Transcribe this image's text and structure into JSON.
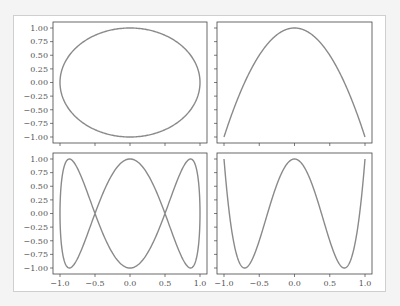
{
  "figure": {
    "frame_color": "#cfcfcf",
    "line_color": "#8a8a8a",
    "axis_color": "#444444"
  },
  "chart_data": [
    {
      "type": "line",
      "title": "",
      "position": "top-left",
      "description": "ellipse x=sin(t), y=cos(t)",
      "x_range": [
        -1.0,
        1.0
      ],
      "ylim": [
        -1.0,
        1.0
      ],
      "yticks": [
        "1.00",
        "0.75",
        "0.50",
        "0.25",
        "0.00",
        "−0.25",
        "−0.50",
        "−0.75",
        "−1.00"
      ],
      "xticks": [],
      "series": [
        {
          "name": "curve",
          "param": "cos(t) vs sin(t)"
        }
      ]
    },
    {
      "type": "line",
      "title": "",
      "position": "top-right",
      "description": "parabola y=1-x^2",
      "x_range": [
        -1.0,
        1.0
      ],
      "ylim": [
        -1.0,
        1.0
      ],
      "yticks": [],
      "xticks": [],
      "series": [
        {
          "name": "curve",
          "x": [
            -1,
            -0.5,
            0,
            0.5,
            1
          ],
          "y": [
            -1,
            0.5,
            1,
            0.5,
            -1
          ]
        }
      ]
    },
    {
      "type": "line",
      "title": "",
      "position": "bottom-left",
      "description": "Lissajous x=sin(t), y=cos(3t)",
      "x_range": [
        -1.0,
        1.0
      ],
      "ylim": [
        -1.0,
        1.0
      ],
      "yticks": [
        "1.00",
        "0.75",
        "0.50",
        "0.25",
        "0.00",
        "−0.25",
        "−0.50",
        "−0.75",
        "−1.00"
      ],
      "xticks": [
        "−1.0",
        "−0.5",
        "0.0",
        "0.5",
        "1.0"
      ],
      "series": [
        {
          "name": "curve"
        }
      ]
    },
    {
      "type": "line",
      "title": "",
      "position": "bottom-right",
      "description": "y=cos(4 arccos x) (Chebyshev T4)",
      "x_range": [
        -1.0,
        1.0
      ],
      "ylim": [
        -1.0,
        1.0
      ],
      "yticks": [],
      "xticks": [
        "−1.0",
        "−0.5",
        "0.0",
        "0.5",
        "1.0"
      ],
      "series": [
        {
          "name": "curve",
          "x": [
            -1,
            -0.707,
            0,
            0.707,
            1
          ],
          "y": [
            1,
            -1,
            1,
            -1,
            1
          ]
        }
      ]
    }
  ]
}
